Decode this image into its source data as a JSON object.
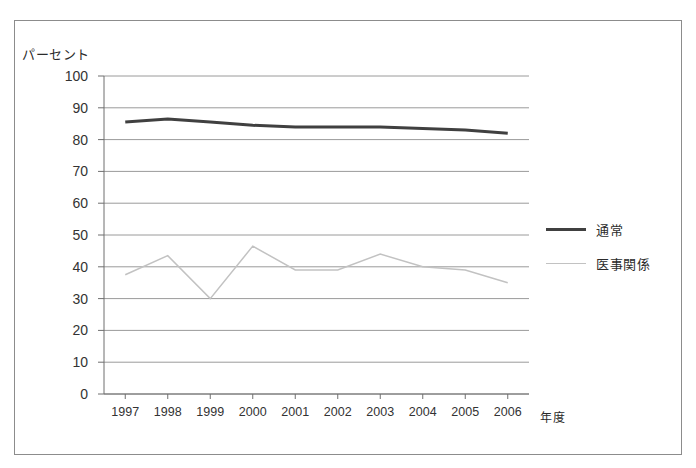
{
  "chart_data": {
    "type": "line",
    "title": "",
    "xlabel": "年度",
    "ylabel": "パーセント",
    "categories": [
      "1997",
      "1998",
      "1999",
      "2000",
      "2001",
      "2002",
      "2003",
      "2004",
      "2005",
      "2006"
    ],
    "ylim": [
      0,
      100
    ],
    "ytick_step": 10,
    "yticks": [
      "100",
      "90",
      "80",
      "70",
      "60",
      "50",
      "40",
      "30",
      "20",
      "10",
      "0"
    ],
    "grid": "horizontal",
    "legend_position": "right",
    "series": [
      {
        "name": "通常",
        "color": "#404040",
        "line_width": 3,
        "values": [
          85.5,
          86.5,
          85.5,
          84.5,
          84,
          84,
          84,
          83.5,
          83,
          82
        ]
      },
      {
        "name": "医事関係",
        "color": "#c2c2c2",
        "line_width": 1.5,
        "values": [
          37.5,
          43.5,
          30,
          46.5,
          39,
          39,
          44,
          40,
          39,
          35
        ]
      }
    ]
  },
  "legend": {
    "items": [
      {
        "label": "通常"
      },
      {
        "label": "医事関係"
      }
    ]
  },
  "axes": {
    "y_axis_title": "パーセント",
    "x_axis_title": "年度"
  },
  "colors": {
    "frame": "#8c8c8c",
    "grid": "#9a9a9a",
    "axis": "#6f6f6f",
    "series_primary": "#404040",
    "series_secondary": "#c2c2c2",
    "background": "#ffffff"
  }
}
